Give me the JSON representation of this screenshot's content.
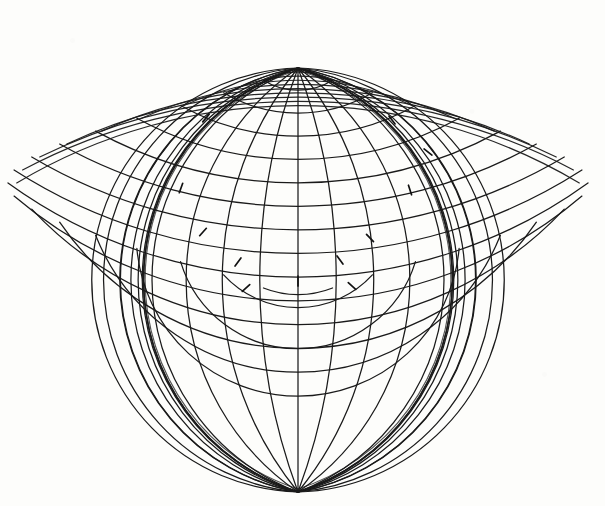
{
  "figure": {
    "subtitle": "Lagrange-type cordiform graticule with pole convergence",
    "medium": "ink-on-paper scan",
    "background_color": "#fdfdfb",
    "ink_color": "#1a1a1a",
    "canvas": {
      "width": 605,
      "height": 506
    }
  },
  "chart_data": {
    "type": "line",
    "xlabel": "",
    "ylabel": "",
    "grid": true,
    "legend_position": "none",
    "projection": {
      "name": "Lagrange / globular",
      "pole_point": {
        "x": 298,
        "y": 68
      },
      "center_meridian_x": 298,
      "equator_y": 280,
      "hemisphere_radius": 290,
      "bounds": {
        "x_min": 12,
        "x_max": 592,
        "y_min": 18,
        "y_max": 492
      }
    },
    "graticule": {
      "meridian_interval_deg": 15,
      "parallel_interval_deg": 10,
      "meridians_deg": [
        -90,
        -75,
        -60,
        -45,
        -30,
        -15,
        0,
        15,
        30,
        45,
        60,
        75,
        90
      ],
      "parallels_deg": [
        -80,
        -70,
        -60,
        -50,
        -40,
        -30,
        -20,
        -10,
        0,
        10,
        20,
        30,
        40,
        50,
        60,
        70,
        80
      ],
      "meridian_count": 25,
      "parallel_count": 17
    },
    "tick_marks": [
      {
        "x": 206,
        "y": 118,
        "angle": 40
      },
      {
        "x": 392,
        "y": 120,
        "angle": -38
      },
      {
        "x": 428,
        "y": 152,
        "angle": -52
      },
      {
        "x": 181,
        "y": 188,
        "angle": 20
      },
      {
        "x": 410,
        "y": 190,
        "angle": -18
      },
      {
        "x": 203,
        "y": 232,
        "angle": 42
      },
      {
        "x": 370,
        "y": 238,
        "angle": -44
      },
      {
        "x": 238,
        "y": 262,
        "angle": 36
      },
      {
        "x": 340,
        "y": 260,
        "angle": -36
      },
      {
        "x": 298,
        "y": 281,
        "angle": 0
      },
      {
        "x": 246,
        "y": 288,
        "angle": 48
      },
      {
        "x": 352,
        "y": 286,
        "angle": -48
      }
    ],
    "series": [
      {
        "name": "meridians",
        "stroke": "#1a1a1a",
        "width": 1.3
      },
      {
        "name": "parallels",
        "stroke": "#1a1a1a",
        "width": 1.3
      },
      {
        "name": "outer-boundary",
        "stroke": "#1a1a1a",
        "width": 1.6
      }
    ]
  }
}
